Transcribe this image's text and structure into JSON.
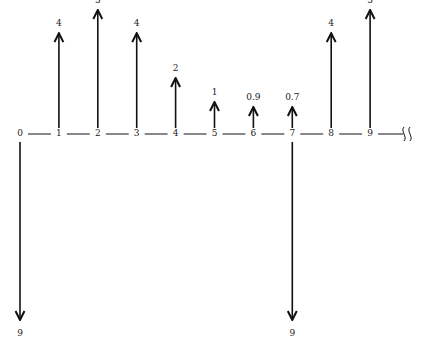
{
  "chart_data": {
    "type": "cash-flow-diagram",
    "title": "",
    "periods": [
      "0",
      "1",
      "2",
      "3",
      "4",
      "5",
      "6",
      "7",
      "8",
      "9"
    ],
    "axis_break_after": "9",
    "inflows": [
      {
        "period": "1",
        "label": "4",
        "value": 4
      },
      {
        "period": "2",
        "label": "5",
        "value": 5
      },
      {
        "period": "3",
        "label": "4",
        "value": 4
      },
      {
        "period": "4",
        "label": "2",
        "value": 2
      },
      {
        "period": "5",
        "label": "1",
        "value": 1
      },
      {
        "period": "6",
        "label": "0.9",
        "value": 0.9
      },
      {
        "period": "7",
        "label": "0.7",
        "value": 0.7
      },
      {
        "period": "8",
        "label": "4",
        "value": 4
      },
      {
        "period": "9",
        "label": "5",
        "value": 5
      }
    ],
    "outflows": [
      {
        "period": "0",
        "label": "9",
        "value": 9
      },
      {
        "period": "7",
        "label": "9",
        "value": 9
      }
    ]
  },
  "colors": {
    "line": "#111111",
    "text": "#222222",
    "background": "#ffffff"
  }
}
